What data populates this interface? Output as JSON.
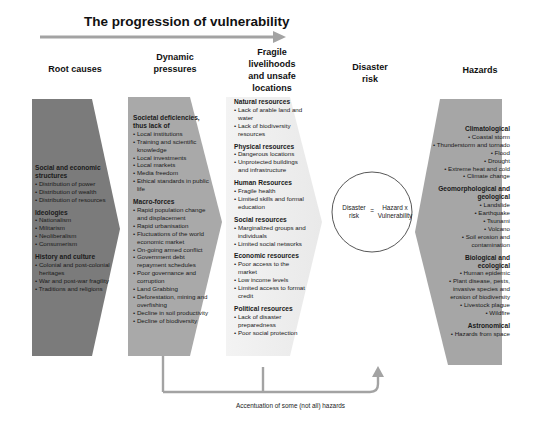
{
  "title": "The progression of vulnerability",
  "colors": {
    "root_causes_fill": "#7b7b7b",
    "dynamic_pressures_fill": "#a9a9a9",
    "fragile_fill": "#f1f1f1",
    "hazards_fill": "#a6a6a6",
    "arrow": "#a3a3a3"
  },
  "columns": {
    "root_causes": {
      "heading": "Root causes",
      "sections": [
        {
          "title": "Social and economic structures",
          "items": [
            "Distribution of power",
            "Distribution of wealth",
            "Distribution of resources"
          ]
        },
        {
          "title": "Ideologies",
          "items": [
            "Nationalism",
            "Militarism",
            "Neoliberalism",
            "Consumerism"
          ]
        },
        {
          "title": "History and culture",
          "items": [
            "Colonial and post-colonial heritages",
            "War and post-war fragility",
            "Traditions and religions"
          ]
        }
      ]
    },
    "dynamic_pressures": {
      "heading_line1": "Dynamic",
      "heading_line2": "pressures",
      "sections": [
        {
          "title": "Societal deficiencies, thus lack of",
          "items": [
            "Local institutions",
            "Training and scientific knowledge",
            "Local investments",
            "Local markets",
            "Media freedom",
            "Ethical standards in public life"
          ]
        },
        {
          "title": "Macro-forces",
          "items": [
            "Rapid population change and displacement",
            "Rapid urbanisation",
            "Fluctuations of the world economic market",
            "On-going armed conflict",
            "Government debt repayment schedules",
            "Poor governance and corruption",
            "Land Grabbing",
            "Deforestation, mining and overfishing",
            "Decline in soil productivity",
            "Decline of biodiversity"
          ]
        }
      ]
    },
    "fragile_livelihoods": {
      "heading_line1": "Fragile",
      "heading_line2": "livelihoods",
      "heading_line3": "and unsafe",
      "heading_line4": "locations",
      "sections": [
        {
          "title": "Natural resources",
          "items": [
            "Lack of arable land and water",
            "Lack of biodiversity resources"
          ]
        },
        {
          "title": "Physical resources",
          "items": [
            "Dangerous locations",
            "Unprotected buildings and infrastructure"
          ]
        },
        {
          "title": "Human Resources",
          "items": [
            "Fragile health",
            "Limited skills and formal education"
          ]
        },
        {
          "title": "Social resources",
          "items": [
            "Marginalized groups and individuals",
            "Limited social networks"
          ]
        },
        {
          "title": "Economic resources",
          "items": [
            "Poor access to the market",
            "Low income levels",
            "Limited access to format credit"
          ]
        },
        {
          "title": "Political resources",
          "items": [
            "Lack of disaster preparedness",
            "Poor social protection"
          ]
        }
      ]
    },
    "disaster_risk": {
      "heading_line1": "Disaster",
      "heading_line2": "risk",
      "equation_left_line1": "Disaster",
      "equation_left_line2": "risk",
      "equation_operator": "=",
      "equation_right_line1": "Hazard x",
      "equation_right_line2": "Vulnerability"
    },
    "hazards": {
      "heading": "Hazards",
      "sections": [
        {
          "title": "Climatological",
          "items": [
            "Coastal storm",
            "Thunderstorm and tornado",
            "Flood",
            "Drought",
            "Extreme heat and cold",
            "Climate change"
          ]
        },
        {
          "title": "Geomorphological and geological",
          "items": [
            "Landslide",
            "Earthquake",
            "Tsunami",
            "Volcano",
            "Soil erosion and contamination"
          ]
        },
        {
          "title": "Biological and ecological",
          "items": [
            "Human epidemic",
            "Plant disease, pests, invasive species and erosion of biodiversity",
            "Livestock plague",
            "Wildfire"
          ]
        },
        {
          "title": "Astronomical",
          "items": [
            "Hazards from space"
          ]
        }
      ]
    }
  },
  "feedback_caption": "Accentuation of some (not all) hazards"
}
